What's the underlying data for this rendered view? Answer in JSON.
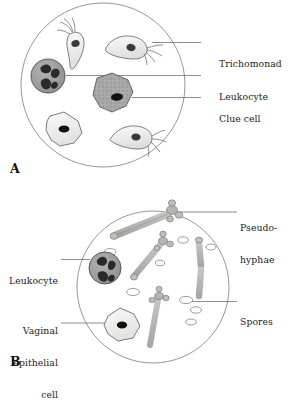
{
  "figure": {
    "type": "medical-microscopy-illustration",
    "background_color": "#ffffff",
    "ink_color": "#1b1b1b",
    "field_outline_color": "#8a8a8a",
    "leader_line_color": "#6e6e6e"
  },
  "panels": [
    {
      "letter": "A",
      "name": "panel-a",
      "field": {
        "cx": 103,
        "cy": 85,
        "r": 82
      },
      "labels": [
        {
          "id": "trichomonad",
          "text": "Trichomonad",
          "side": "right",
          "lines": [
            "Trichomonad"
          ],
          "text_x": 219,
          "text_y": 38,
          "leader": {
            "x1": 201,
            "y1": 42.5,
            "x2": 152,
            "y2": 42.5
          }
        },
        {
          "id": "leukocyte",
          "text": "Leukocyte",
          "side": "right",
          "lines": [
            "Leukocyte"
          ],
          "text_x": 219,
          "text_y": 71,
          "leader": {
            "x1": 201,
            "y1": 75.5,
            "x2": 66,
            "y2": 75.5
          }
        },
        {
          "id": "clue-cell",
          "text": "Clue cell",
          "side": "right",
          "lines": [
            "Clue cell"
          ],
          "text_x": 219,
          "text_y": 93,
          "leader": {
            "x1": 201,
            "y1": 97.5,
            "x2": 132,
            "y2": 97.5
          }
        }
      ],
      "cells": [
        {
          "type": "trichomonad",
          "name": "trichomonad-upper-left"
        },
        {
          "type": "trichomonad",
          "name": "trichomonad-upper-right"
        },
        {
          "type": "trichomonad",
          "name": "trichomonad-lower-right"
        },
        {
          "type": "leukocyte",
          "name": "leukocyte-cell"
        },
        {
          "type": "clue-cell",
          "name": "clue-cell"
        },
        {
          "type": "epithelial-cell",
          "name": "epithelial-cell"
        }
      ]
    },
    {
      "letter": "B",
      "name": "panel-b",
      "field": {
        "cx": 153,
        "cy": 287,
        "r": 76
      },
      "labels": [
        {
          "id": "pseudohyphae",
          "text": "Pseudo-hyphae",
          "side": "right",
          "lines": [
            "Pseudo-",
            "hyphae"
          ],
          "text_x": 240,
          "text_y": 207,
          "leader": {
            "x1": 237,
            "y1": 212,
            "x2": 176,
            "y2": 212
          }
        },
        {
          "id": "spores",
          "text": "Spores",
          "side": "right",
          "lines": [
            "Spores"
          ],
          "text_x": 240,
          "text_y": 297,
          "leader": {
            "x1": 237,
            "y1": 301.5,
            "x2": 186,
            "y2": 301.5
          }
        },
        {
          "id": "leukocyte-b",
          "text": "Leukocyte",
          "side": "left",
          "lines": [
            "Leukocyte"
          ],
          "text_x": 58,
          "text_y": 255,
          "leader": {
            "x1": 61,
            "y1": 259.5,
            "x2": 90,
            "y2": 259.5
          }
        },
        {
          "id": "vaginal-epithelial-cell",
          "text": "Vaginal epithelial cell",
          "side": "left",
          "lines": [
            "Vaginal",
            "epithelial",
            "cell"
          ],
          "text_x": 58,
          "text_y": 307,
          "leader": {
            "x1": 61,
            "y1": 323,
            "x2": 106,
            "y2": 323
          }
        }
      ],
      "cells": [
        {
          "type": "pseudohyphae",
          "name": "pseudohyphae-top"
        },
        {
          "type": "pseudohyphae",
          "name": "pseudohyphae-middle"
        },
        {
          "type": "pseudohyphae",
          "name": "pseudohyphae-lower"
        },
        {
          "type": "pseudohyphae",
          "name": "pseudohyphae-right-vertical"
        },
        {
          "type": "spore",
          "name": "spore-cluster"
        },
        {
          "type": "leukocyte",
          "name": "leukocyte-cell-b"
        },
        {
          "type": "epithelial-cell",
          "name": "vaginal-epithelial-cell-shape"
        }
      ]
    }
  ],
  "colors": {
    "cell_fill_light": "#f2f2f0",
    "cell_stroke": "#6b6b6b",
    "leukocyte_fill": "#9a9a9a",
    "leukocyte_nucleus": "#2a2a2a",
    "clue_cell_fill": "#a8a8a8",
    "nucleus_black": "#151515",
    "hypha_fill": "#b4b4b0",
    "hypha_stroke": "#7d7d7d",
    "spore_stroke": "#8c8c8c"
  }
}
